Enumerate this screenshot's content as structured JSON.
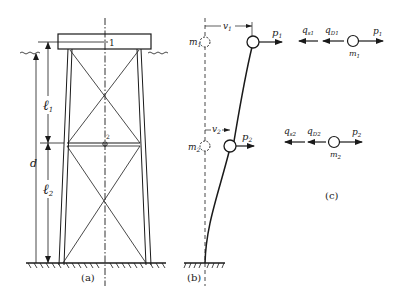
{
  "figure": {
    "panels": [
      {
        "id": "a",
        "label": "(a)",
        "description": "Offshore jacket platform with deck, two braced bays"
      },
      {
        "id": "b",
        "label": "(b)",
        "description": "Deflected two-mass lumped model"
      },
      {
        "id": "c",
        "label": "(c)",
        "description": "Free-body force diagrams of masses"
      }
    ],
    "panel_a": {
      "label": "(a)",
      "node_top": "1",
      "node_mid": "2",
      "dim_l1": "ℓ",
      "dim_l1_sub": "1",
      "dim_l2": "ℓ",
      "dim_l2_sub": "2",
      "dim_d": "d"
    },
    "panel_b": {
      "label": "(b)",
      "m1": "m",
      "m1_sub": "1",
      "m2": "m",
      "m2_sub": "2",
      "v1": "v",
      "v1_sub": "1",
      "v2": "v",
      "v2_sub": "2",
      "p1": "p",
      "p1_sub": "1",
      "p2": "p",
      "p2_sub": "2"
    },
    "panel_c": {
      "label": "(c)",
      "row1": {
        "qs": "q",
        "qs_sub": "s1",
        "qd": "q",
        "qd_sub": "D1",
        "mass": "m",
        "mass_sub": "1",
        "p": "p",
        "p_sub": "1"
      },
      "row2": {
        "qs": "q",
        "qs_sub": "s2",
        "qd": "q",
        "qd_sub": "D2",
        "mass": "m",
        "mass_sub": "2",
        "p": "p",
        "p_sub": "2"
      }
    },
    "colors": {
      "ink": "#1a1a1a",
      "background": "#ffffff"
    }
  }
}
